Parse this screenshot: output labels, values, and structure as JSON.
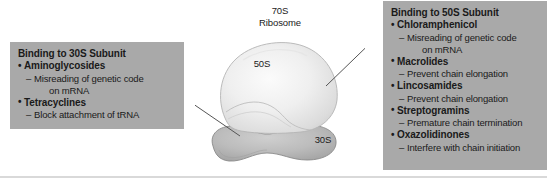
{
  "figure": {
    "title_center": {
      "line1": "70S",
      "line2": "Ribosome"
    },
    "subunit_labels": {
      "large": "50S",
      "small": "30S"
    },
    "colors": {
      "callout_background": "#a9a9a9",
      "text": "#1a1a1a",
      "subunit_50s": "#e6e6e6",
      "subunit_30s": "#b0b0b0",
      "leader_line": "#555555",
      "page_background": "#ffffff"
    }
  },
  "left_callout": {
    "title": "Binding to 30S Subunit",
    "drugs": [
      {
        "name": "Aminoglycosides",
        "effect": "Misreading of genetic code",
        "effect_cont": "on mRNA"
      },
      {
        "name": "Tetracyclines",
        "effect": "Block attachment of tRNA",
        "effect_cont": ""
      }
    ]
  },
  "right_callout": {
    "title": "Binding to 50S Subunit",
    "drugs": [
      {
        "name": "Chloramphenicol",
        "effect": "Misreading of genetic code",
        "effect_cont": "on mRNA"
      },
      {
        "name": "Macrolides",
        "effect": "Prevent chain elongation",
        "effect_cont": ""
      },
      {
        "name": "Lincosamides",
        "effect": "Prevent chain elongation",
        "effect_cont": ""
      },
      {
        "name": "Streptogramins",
        "effect": "Premature chain termination",
        "effect_cont": ""
      },
      {
        "name": "Oxazolidinones",
        "effect": "Interfere with chain initiation",
        "effect_cont": ""
      }
    ]
  },
  "glyphs": {
    "bullet": "•",
    "dash": "–"
  }
}
